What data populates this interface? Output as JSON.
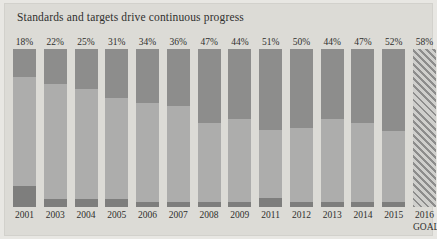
{
  "chart_data": {
    "type": "bar",
    "title": "Standards and targets drive continuous progress",
    "xlabel": "",
    "ylabel": "",
    "ylim": [
      0,
      100
    ],
    "grid": false,
    "legend": null,
    "categories": [
      "2001",
      "2003",
      "2004",
      "2005",
      "2006",
      "2007",
      "2008",
      "2009",
      "2011",
      "2012",
      "2013",
      "2014",
      "2015",
      "2016"
    ],
    "values": [
      18,
      22,
      25,
      31,
      34,
      36,
      47,
      44,
      51,
      50,
      44,
      47,
      52,
      58
    ],
    "data_labels": [
      "18%",
      "22%",
      "25%",
      "31%",
      "34%",
      "36%",
      "47%",
      "44%",
      "51%",
      "50%",
      "44%",
      "47%",
      "52%",
      "58%"
    ],
    "annotations": [
      {
        "category": "2016",
        "text": "GOAL"
      }
    ],
    "series": [
      {
        "name": "Top segment (share achieved)",
        "values": [
          18,
          22,
          25,
          31,
          34,
          36,
          47,
          44,
          51,
          50,
          44,
          47,
          52,
          58
        ]
      },
      {
        "name": "Bottom segment",
        "values": [
          13,
          5,
          5,
          5,
          3,
          3,
          3,
          3,
          6,
          3,
          3,
          3,
          3,
          0
        ]
      }
    ],
    "colors": {
      "segment_top": "#8d8d8c",
      "segment_middle": "#adadac",
      "segment_bottom": "#7e7e7d",
      "goal_hatch": "#8d8d8c",
      "plot_background": "#dcdbd6",
      "figure_background": "#e8e7e3",
      "text": "#2f2f2d"
    }
  },
  "bars": [
    {
      "label": "18%",
      "year": "2001",
      "note": "",
      "top": 18,
      "bottom": 13,
      "goal": false
    },
    {
      "label": "22%",
      "year": "2003",
      "note": "",
      "top": 22,
      "bottom": 5,
      "goal": false
    },
    {
      "label": "25%",
      "year": "2004",
      "note": "",
      "top": 25,
      "bottom": 5,
      "goal": false
    },
    {
      "label": "31%",
      "year": "2005",
      "note": "",
      "top": 31,
      "bottom": 5,
      "goal": false
    },
    {
      "label": "34%",
      "year": "2006",
      "note": "",
      "top": 34,
      "bottom": 3,
      "goal": false
    },
    {
      "label": "36%",
      "year": "2007",
      "note": "",
      "top": 36,
      "bottom": 3,
      "goal": false
    },
    {
      "label": "47%",
      "year": "2008",
      "note": "",
      "top": 47,
      "bottom": 3,
      "goal": false
    },
    {
      "label": "44%",
      "year": "2009",
      "note": "",
      "top": 44,
      "bottom": 3,
      "goal": false
    },
    {
      "label": "51%",
      "year": "2011",
      "note": "",
      "top": 51,
      "bottom": 6,
      "goal": false
    },
    {
      "label": "50%",
      "year": "2012",
      "note": "",
      "top": 50,
      "bottom": 3,
      "goal": false
    },
    {
      "label": "44%",
      "year": "2013",
      "note": "",
      "top": 44,
      "bottom": 3,
      "goal": false
    },
    {
      "label": "47%",
      "year": "2014",
      "note": "",
      "top": 47,
      "bottom": 3,
      "goal": false
    },
    {
      "label": "52%",
      "year": "2015",
      "note": "",
      "top": 52,
      "bottom": 3,
      "goal": false
    },
    {
      "label": "58%",
      "year": "2016",
      "note": "GOAL",
      "top": 58,
      "bottom": 0,
      "goal": true
    }
  ]
}
